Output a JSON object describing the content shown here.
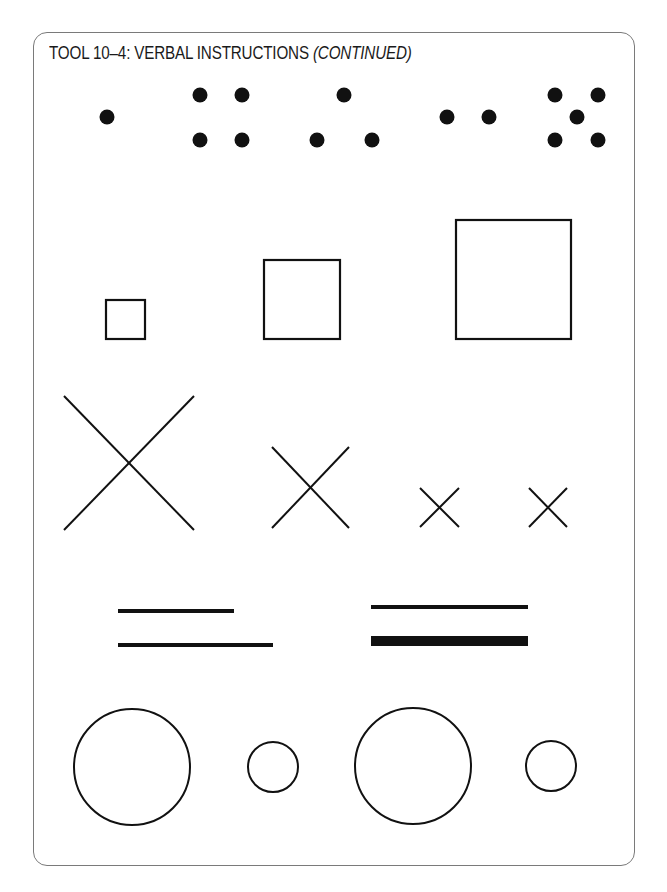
{
  "page": {
    "title_prefix": "TOOL 10–4: VERBAL INSTRUCTIONS ",
    "title_suffix": "(CONTINUED)",
    "ink_color": "#111111",
    "frame_color": "#7a7a7a"
  },
  "rows": [
    {
      "name": "dot-patterns",
      "items": [
        {
          "type": "dots",
          "count": 1,
          "points": [
            [
              107,
              117
            ]
          ]
        },
        {
          "type": "dots",
          "count": 4,
          "points": [
            [
              200,
              95
            ],
            [
              242,
              95
            ],
            [
              200,
              140
            ],
            [
              242,
              140
            ]
          ]
        },
        {
          "type": "dots",
          "count": 3,
          "points": [
            [
              344,
              95
            ],
            [
              317,
              140
            ],
            [
              372,
              140
            ]
          ]
        },
        {
          "type": "dots",
          "count": 2,
          "points": [
            [
              447,
              117
            ],
            [
              489,
              117
            ]
          ]
        },
        {
          "type": "dots",
          "count": 5,
          "points": [
            [
              555,
              95
            ],
            [
              598,
              95
            ],
            [
              577,
              117
            ],
            [
              555,
              140
            ],
            [
              598,
              140
            ]
          ]
        }
      ]
    },
    {
      "name": "squares",
      "items": [
        {
          "type": "square",
          "size": "small",
          "x": 106,
          "y": 300,
          "w": 39,
          "h": 39
        },
        {
          "type": "square",
          "size": "medium",
          "x": 264,
          "y": 260,
          "w": 76,
          "h": 79
        },
        {
          "type": "square",
          "size": "large",
          "x": 456,
          "y": 220,
          "w": 115,
          "h": 119
        }
      ]
    },
    {
      "name": "crosses",
      "items": [
        {
          "type": "x",
          "size": "large",
          "x1": 64,
          "y1": 396,
          "x2": 194,
          "y2": 530
        },
        {
          "type": "x",
          "size": "medium",
          "x1": 272,
          "y1": 447,
          "x2": 349,
          "y2": 528
        },
        {
          "type": "x",
          "size": "small",
          "x1": 420,
          "y1": 488,
          "x2": 459,
          "y2": 527
        },
        {
          "type": "x",
          "size": "small",
          "x1": 529,
          "y1": 488,
          "x2": 567,
          "y2": 527
        }
      ]
    },
    {
      "name": "lines",
      "items": [
        {
          "type": "line",
          "group": "left",
          "label": "short-thin",
          "x1": 118,
          "x2": 234,
          "y": 611,
          "thickness": 4
        },
        {
          "type": "line",
          "group": "left",
          "label": "long-thin",
          "x1": 118,
          "x2": 273,
          "y": 645,
          "thickness": 4
        },
        {
          "type": "line",
          "group": "right",
          "label": "thin",
          "x1": 371,
          "x2": 528,
          "y": 607,
          "thickness": 4
        },
        {
          "type": "line",
          "group": "right",
          "label": "thick",
          "x1": 371,
          "x2": 528,
          "y": 641,
          "thickness": 10
        }
      ]
    },
    {
      "name": "circles",
      "items": [
        {
          "type": "circle",
          "size": "large",
          "cx": 132,
          "cy": 767,
          "r": 58
        },
        {
          "type": "circle",
          "size": "small",
          "cx": 273,
          "cy": 767,
          "r": 25
        },
        {
          "type": "circle",
          "size": "large",
          "cx": 413,
          "cy": 766,
          "r": 58
        },
        {
          "type": "circle",
          "size": "small",
          "cx": 551,
          "cy": 766,
          "r": 25
        }
      ]
    }
  ]
}
